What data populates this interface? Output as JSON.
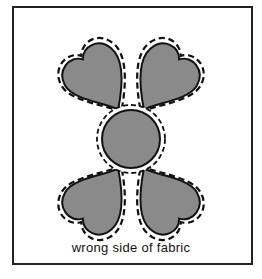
{
  "diagram": {
    "caption": "wrong side of fabric",
    "colors": {
      "fill": "#8a8a8a",
      "outline": "#111111",
      "seam_line": "#111111",
      "frame": "#222222",
      "background": "#ffffff"
    },
    "shapes": [
      {
        "type": "heart",
        "position": "top-left"
      },
      {
        "type": "heart",
        "position": "top-right"
      },
      {
        "type": "heart",
        "position": "bottom-left"
      },
      {
        "type": "heart",
        "position": "bottom-right"
      },
      {
        "type": "circle",
        "position": "center"
      }
    ]
  }
}
